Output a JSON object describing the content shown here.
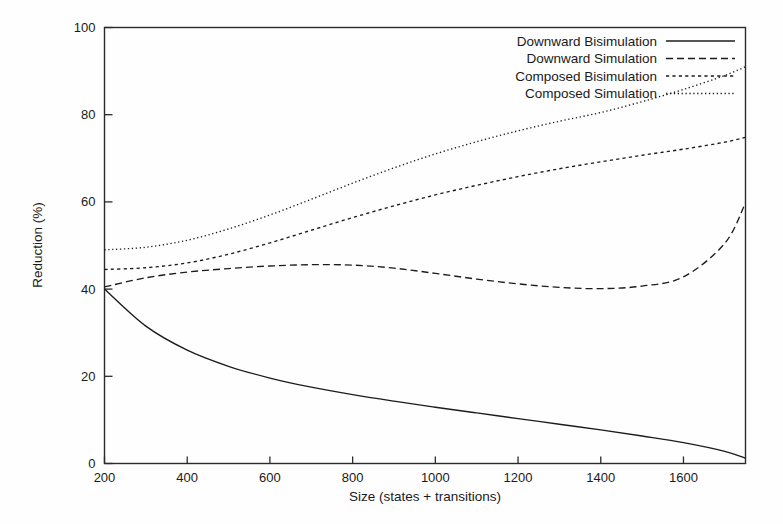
{
  "chart_data": {
    "type": "line",
    "title": "",
    "xlabel": "Size (states + transitions)",
    "ylabel": "Reduction (%)",
    "xlim": [
      200,
      1750
    ],
    "ylim": [
      0,
      100
    ],
    "xticks": [
      200,
      400,
      600,
      800,
      1000,
      1200,
      1400,
      1600
    ],
    "yticks": [
      0,
      20,
      40,
      60,
      80,
      100
    ],
    "grid": false,
    "legend_position": "top-right",
    "x": [
      200,
      300,
      400,
      500,
      600,
      700,
      800,
      900,
      1000,
      1100,
      1200,
      1300,
      1400,
      1500,
      1600,
      1700,
      1750
    ],
    "series": [
      {
        "name": "Downward Bisimulation",
        "style": "solid",
        "values": [
          40.0,
          31.5,
          26.0,
          22.3,
          19.6,
          17.5,
          15.8,
          14.3,
          12.9,
          11.6,
          10.3,
          9.0,
          7.7,
          6.3,
          4.8,
          2.8,
          1.2
        ]
      },
      {
        "name": "Downward Simulation",
        "style": "dashed",
        "values": [
          40.5,
          42.6,
          43.9,
          44.7,
          45.3,
          45.6,
          45.5,
          44.8,
          43.6,
          42.3,
          41.2,
          40.4,
          40.1,
          40.7,
          42.8,
          50.5,
          59.8
        ]
      },
      {
        "name": "Composed Bisimulation",
        "style": "dotted",
        "values": [
          44.5,
          44.9,
          46.0,
          48.0,
          50.6,
          53.5,
          56.4,
          59.1,
          61.6,
          63.8,
          65.8,
          67.6,
          69.2,
          70.7,
          72.1,
          73.7,
          74.8
        ]
      },
      {
        "name": "Composed Simulation",
        "style": "fine-dotted",
        "values": [
          49.0,
          49.6,
          51.2,
          53.8,
          57.0,
          60.6,
          64.3,
          67.8,
          71.0,
          73.8,
          76.3,
          78.5,
          80.5,
          83.0,
          85.8,
          89.0,
          91.0
        ]
      }
    ]
  }
}
